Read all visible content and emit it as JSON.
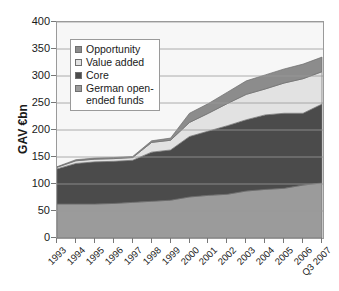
{
  "chart_data": {
    "type": "area",
    "stacked": true,
    "title": "",
    "xlabel": "",
    "ylabel": "GAV €bn",
    "ylim": [
      0,
      400
    ],
    "yticks": [
      0,
      50,
      100,
      150,
      200,
      250,
      300,
      350,
      400
    ],
    "grid": true,
    "grid_axis": "y",
    "legend_position": "upper-left-inside",
    "categories": [
      "1993",
      "1994",
      "1995",
      "1996",
      "1997",
      "1998",
      "1999",
      "2000",
      "2001",
      "2002",
      "2003",
      "2004",
      "2005",
      "2006",
      "Q3 2007"
    ],
    "series": [
      {
        "name": "German open-ended funds",
        "color": "#9b9b9b",
        "values": [
          63,
          63,
          63,
          64,
          66,
          68,
          70,
          76,
          79,
          81,
          87,
          90,
          92,
          98,
          102
        ]
      },
      {
        "name": "Core",
        "color": "#4b4b4b",
        "values": [
          65,
          75,
          78,
          78,
          78,
          91,
          93,
          112,
          119,
          127,
          132,
          138,
          139,
          133,
          146
        ]
      },
      {
        "name": "Value added",
        "color": "#e2e2e2",
        "values": [
          3,
          5,
          5,
          5,
          5,
          18,
          18,
          26,
          33,
          41,
          47,
          48,
          56,
          64,
          60
        ]
      },
      {
        "name": "Opportunity",
        "color": "#8c8c8c",
        "values": [
          1,
          2,
          2,
          2,
          2,
          3,
          4,
          17,
          18,
          21,
          25,
          26,
          26,
          27,
          27
        ]
      }
    ],
    "cumulative_tops": {
      "german_open_ended_funds": [
        63,
        63,
        63,
        64,
        66,
        68,
        70,
        76,
        79,
        81,
        87,
        90,
        92,
        98,
        102
      ],
      "core": [
        128,
        138,
        141,
        142,
        144,
        159,
        163,
        188,
        198,
        208,
        219,
        228,
        231,
        231,
        248
      ],
      "value_added": [
        131,
        143,
        146,
        147,
        149,
        177,
        181,
        214,
        231,
        249,
        266,
        276,
        287,
        295,
        308
      ],
      "opportunity_total": [
        132,
        145,
        148,
        149,
        151,
        180,
        185,
        231,
        249,
        270,
        291,
        302,
        313,
        322,
        335
      ]
    }
  },
  "axes": {
    "y_title": "GAV €bn",
    "y_tick_labels": [
      "400",
      "350",
      "300",
      "250",
      "200",
      "150",
      "100",
      "50",
      "0"
    ],
    "x_tick_labels": [
      "1993",
      "1994",
      "1995",
      "1996",
      "1997",
      "1998",
      "1999",
      "2000",
      "2001",
      "2002",
      "2003",
      "2004",
      "2005",
      "2006",
      "Q3 2007"
    ]
  },
  "legend": {
    "items": [
      {
        "label": "Opportunity",
        "color": "#8c8c8c"
      },
      {
        "label": "Value added",
        "color": "#e2e2e2"
      },
      {
        "label": "Core",
        "color": "#4b4b4b"
      },
      {
        "label": "German open-\nended funds",
        "color": "#9b9b9b"
      }
    ]
  },
  "colors": {
    "plot_background": "#f7f7f7",
    "grid_line": "#9a9a9a",
    "axis_line": "#777777",
    "text": "#1a1a1a"
  }
}
